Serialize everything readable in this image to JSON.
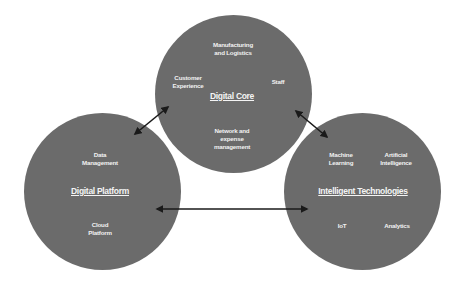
{
  "diagram": {
    "nodes": [
      {
        "id": "digital-core",
        "title": "Digital Core",
        "items": [
          "Manufacturing and Logistics",
          "Customer Experience",
          "Staff",
          "Network and expense management"
        ]
      },
      {
        "id": "digital-platform",
        "title": "Digital Platform",
        "items": [
          "Data Management",
          "Cloud Platform"
        ]
      },
      {
        "id": "intelligent-technologies",
        "title": "Intelligent Technologies",
        "items": [
          "Machine Learning",
          "Artificial Intelligence",
          "IoT",
          "Analytics"
        ]
      }
    ],
    "edges": [
      {
        "from": "digital-platform",
        "to": "digital-core",
        "type": "bidirectional"
      },
      {
        "from": "digital-core",
        "to": "intelligent-technologies",
        "type": "bidirectional"
      },
      {
        "from": "digital-platform",
        "to": "intelligent-technologies",
        "type": "bidirectional"
      }
    ],
    "colors": {
      "circle_fill": "#6b6b6b",
      "text": "#f2f2f2",
      "arrow": "#1a1a1a",
      "background": "#ffffff"
    }
  },
  "core": {
    "title": "Digital Core",
    "item1_line1": "Manufacturing",
    "item1_line2": "and Logistics",
    "item2_line1": "Customer",
    "item2_line2": "Experience",
    "item3": "Staff",
    "item4_line1": "Network and",
    "item4_line2": "expense",
    "item4_line3": "management"
  },
  "platform": {
    "title": "Digital Platform",
    "item1_line1": "Data",
    "item1_line2": "Management",
    "item2_line1": "Cloud",
    "item2_line2": "Platform"
  },
  "intel": {
    "title": "Intelligent Technologies",
    "item1_line1": "Machine",
    "item1_line2": "Learning",
    "item2_line1": "Artificial",
    "item2_line2": "Intelligence",
    "item3": "IoT",
    "item4": "Analytics"
  }
}
